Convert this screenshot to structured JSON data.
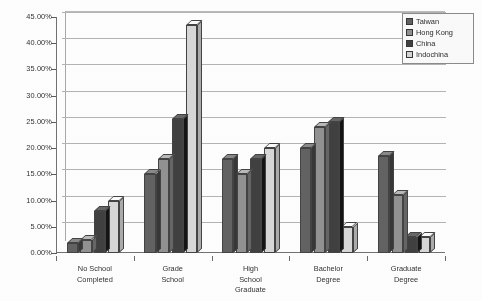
{
  "chart_data": {
    "type": "bar",
    "title": "",
    "subtitle": "",
    "xlabel": "",
    "ylabel": "",
    "ylim": [
      0,
      45
    ],
    "grid": true,
    "legend_position": "top-right",
    "style": "3d-clustered-bar-grayscale-scan",
    "categories": [
      "No School\nCompleted",
      "Grade\nSchool",
      "High\nSchool\nGraduate",
      "Bachelor\nDegree",
      "Graduate\nDegree"
    ],
    "ytick_labels": [
      "0.00%",
      "5.00%",
      "10.00%",
      "15.00%",
      "20.00%",
      "25.00%",
      "30.00%",
      "35.00%",
      "40.00%",
      "45.00%"
    ],
    "ytick_values": [
      0,
      5,
      10,
      15,
      20,
      25,
      30,
      35,
      40,
      45
    ],
    "series": [
      {
        "name": "Taiwan",
        "color": "#5e5e5e",
        "values": [
          2.0,
          15.0,
          18.0,
          20.0,
          18.5
        ]
      },
      {
        "name": "Hong Kong",
        "color": "#8f8f8f",
        "values": [
          2.5,
          18.0,
          15.0,
          24.0,
          11.0
        ]
      },
      {
        "name": "China",
        "color": "#3a3a3a",
        "values": [
          8.0,
          25.5,
          18.0,
          25.0,
          3.0
        ]
      },
      {
        "name": "Indochina",
        "color": "#d8d8d8",
        "values": [
          10.0,
          43.5,
          20.0,
          5.0,
          3.0
        ]
      }
    ]
  },
  "legend": {
    "items": [
      {
        "label": "Taiwan",
        "color": "#5e5e5e"
      },
      {
        "label": "Hong Kong",
        "color": "#8f8f8f"
      },
      {
        "label": "China",
        "color": "#3a3a3a"
      },
      {
        "label": "Indochina",
        "color": "#d8d8d8"
      }
    ]
  }
}
